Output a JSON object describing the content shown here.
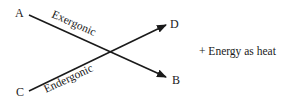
{
  "diagram": {
    "nodes": {
      "a": "A",
      "b": "B",
      "c": "C",
      "d": "D"
    },
    "edges": {
      "exergonic": {
        "label": "Exergonic",
        "from": "A",
        "to": "B"
      },
      "endergonic": {
        "label": "Endergonic",
        "from": "C",
        "to": "D"
      }
    },
    "annotation": "+  Energy as heat"
  }
}
